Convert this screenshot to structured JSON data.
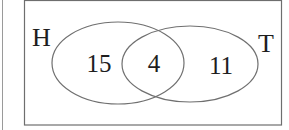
{
  "diagram": {
    "type": "venn",
    "sets": [
      {
        "label": "H",
        "only_count": "15"
      },
      {
        "label": "T",
        "only_count": "11"
      }
    ],
    "intersection_count": "4",
    "colors": {
      "line": "#6e6e6e",
      "frame": "#6e6e6e",
      "text": "#1e1e1e",
      "background": "#ffffff"
    }
  }
}
